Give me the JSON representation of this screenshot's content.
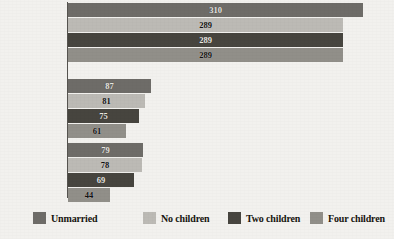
{
  "chart_data": {
    "type": "bar",
    "orientation": "horizontal",
    "title": "",
    "subtitle": "",
    "xlabel": "",
    "ylabel": "",
    "grid": false,
    "legend_position": "bottom",
    "xlim": [
      0,
      330
    ],
    "categories": [
      "High-skilled",
      "Mid-skilled",
      "Low-skilled"
    ],
    "series": [
      {
        "name": "Unmarried",
        "color": "#6e6c68",
        "values": [
          310,
          87,
          79
        ]
      },
      {
        "name": "No children",
        "color": "#bcbab5",
        "values": [
          289,
          81,
          78
        ]
      },
      {
        "name": "Two children",
        "color": "#47453f",
        "values": [
          289,
          75,
          69
        ]
      },
      {
        "name": "Four children",
        "color": "#918f89",
        "values": [
          289,
          61,
          44
        ]
      }
    ]
  },
  "axis": {
    "categories": [
      {
        "label": "High-skilled"
      },
      {
        "label": "Mid-skilled"
      },
      {
        "label": "Low-skilled"
      }
    ]
  },
  "legend": {
    "items": [
      {
        "label": "Unmarried",
        "color": "#6e6c68"
      },
      {
        "label": "No children",
        "color": "#bcbab5"
      },
      {
        "label": "Two children",
        "color": "#47453f"
      },
      {
        "label": "Four children",
        "color": "#918f89"
      }
    ]
  }
}
